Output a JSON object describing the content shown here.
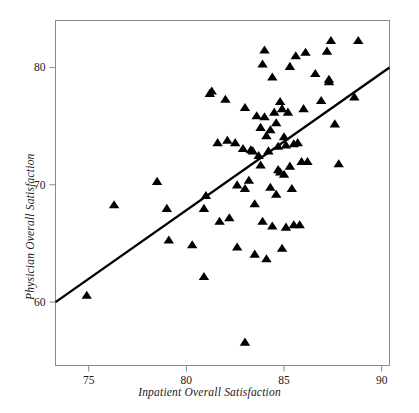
{
  "chart_data": {
    "type": "scatter",
    "title": "",
    "xlabel": "Inpatient Overall Satisfaction",
    "ylabel": "Physician Overall Satisfaction",
    "xlim": [
      73.3,
      90.4
    ],
    "ylim": [
      54.6,
      84.0
    ],
    "xticks": [
      75,
      80,
      85,
      90
    ],
    "yticks": [
      60,
      70,
      80
    ],
    "grid": false,
    "legend": null,
    "marker": "triangle-up",
    "marker_color": "#000000",
    "series": [
      {
        "name": "Hospitals",
        "points": [
          [
            74.9,
            60.6
          ],
          [
            76.3,
            68.3
          ],
          [
            78.5,
            70.3
          ],
          [
            79.0,
            68.0
          ],
          [
            79.1,
            65.3
          ],
          [
            80.3,
            64.9
          ],
          [
            80.9,
            62.2
          ],
          [
            80.9,
            68.0
          ],
          [
            81.0,
            69.1
          ],
          [
            81.2,
            77.8
          ],
          [
            81.3,
            78.0
          ],
          [
            81.6,
            73.6
          ],
          [
            81.7,
            66.9
          ],
          [
            82.0,
            77.3
          ],
          [
            82.1,
            73.8
          ],
          [
            82.2,
            67.2
          ],
          [
            82.5,
            73.6
          ],
          [
            82.6,
            70.0
          ],
          [
            82.6,
            64.7
          ],
          [
            82.9,
            73.1
          ],
          [
            83.0,
            56.6
          ],
          [
            83.0,
            69.7
          ],
          [
            83.0,
            76.6
          ],
          [
            83.2,
            70.4
          ],
          [
            83.3,
            73.0
          ],
          [
            83.4,
            72.9
          ],
          [
            83.5,
            64.1
          ],
          [
            83.5,
            68.4
          ],
          [
            83.6,
            75.9
          ],
          [
            83.7,
            72.5
          ],
          [
            83.8,
            74.9
          ],
          [
            83.8,
            71.7
          ],
          [
            83.9,
            80.3
          ],
          [
            83.9,
            66.9
          ],
          [
            84.0,
            81.5
          ],
          [
            84.0,
            75.8
          ],
          [
            84.1,
            63.7
          ],
          [
            84.1,
            74.2
          ],
          [
            84.2,
            72.9
          ],
          [
            84.3,
            69.8
          ],
          [
            84.3,
            74.7
          ],
          [
            84.4,
            79.2
          ],
          [
            84.4,
            66.5
          ],
          [
            84.5,
            76.2
          ],
          [
            84.6,
            75.3
          ],
          [
            84.6,
            69.2
          ],
          [
            84.7,
            71.3
          ],
          [
            84.7,
            73.3
          ],
          [
            84.8,
            77.1
          ],
          [
            84.8,
            71.1
          ],
          [
            84.9,
            76.5
          ],
          [
            84.9,
            64.6
          ],
          [
            85.0,
            74.1
          ],
          [
            85.0,
            70.9
          ],
          [
            85.1,
            66.4
          ],
          [
            85.1,
            73.4
          ],
          [
            85.2,
            76.2
          ],
          [
            85.3,
            80.1
          ],
          [
            85.3,
            71.6
          ],
          [
            85.4,
            69.7
          ],
          [
            85.5,
            73.5
          ],
          [
            85.5,
            66.6
          ],
          [
            85.6,
            81.0
          ],
          [
            85.7,
            73.6
          ],
          [
            85.8,
            66.6
          ],
          [
            85.9,
            72.0
          ],
          [
            86.0,
            76.5
          ],
          [
            86.1,
            81.3
          ],
          [
            86.2,
            72.0
          ],
          [
            86.6,
            79.5
          ],
          [
            86.9,
            77.2
          ],
          [
            87.2,
            81.4
          ],
          [
            87.3,
            79.0
          ],
          [
            87.3,
            78.8
          ],
          [
            87.4,
            82.3
          ],
          [
            87.6,
            75.2
          ],
          [
            87.8,
            71.8
          ],
          [
            88.6,
            77.5
          ],
          [
            88.8,
            82.3
          ]
        ]
      }
    ],
    "trendline": {
      "name": "least-squares fit",
      "x_start": 73.3,
      "y_start": 60.0,
      "x_end": 90.4,
      "y_end": 80.0,
      "color": "#000000",
      "width": 2.4
    }
  },
  "axes": {
    "xtick_labels": [
      "75",
      "80",
      "85",
      "90"
    ],
    "ytick_labels": [
      "80",
      "70",
      "60"
    ],
    "x_title": "Inpatient Overall Satisfaction",
    "y_title": "Physician Overall Satisfaction"
  },
  "frame": {
    "border_color": "#8a8a8a",
    "background": "#ffffff"
  }
}
